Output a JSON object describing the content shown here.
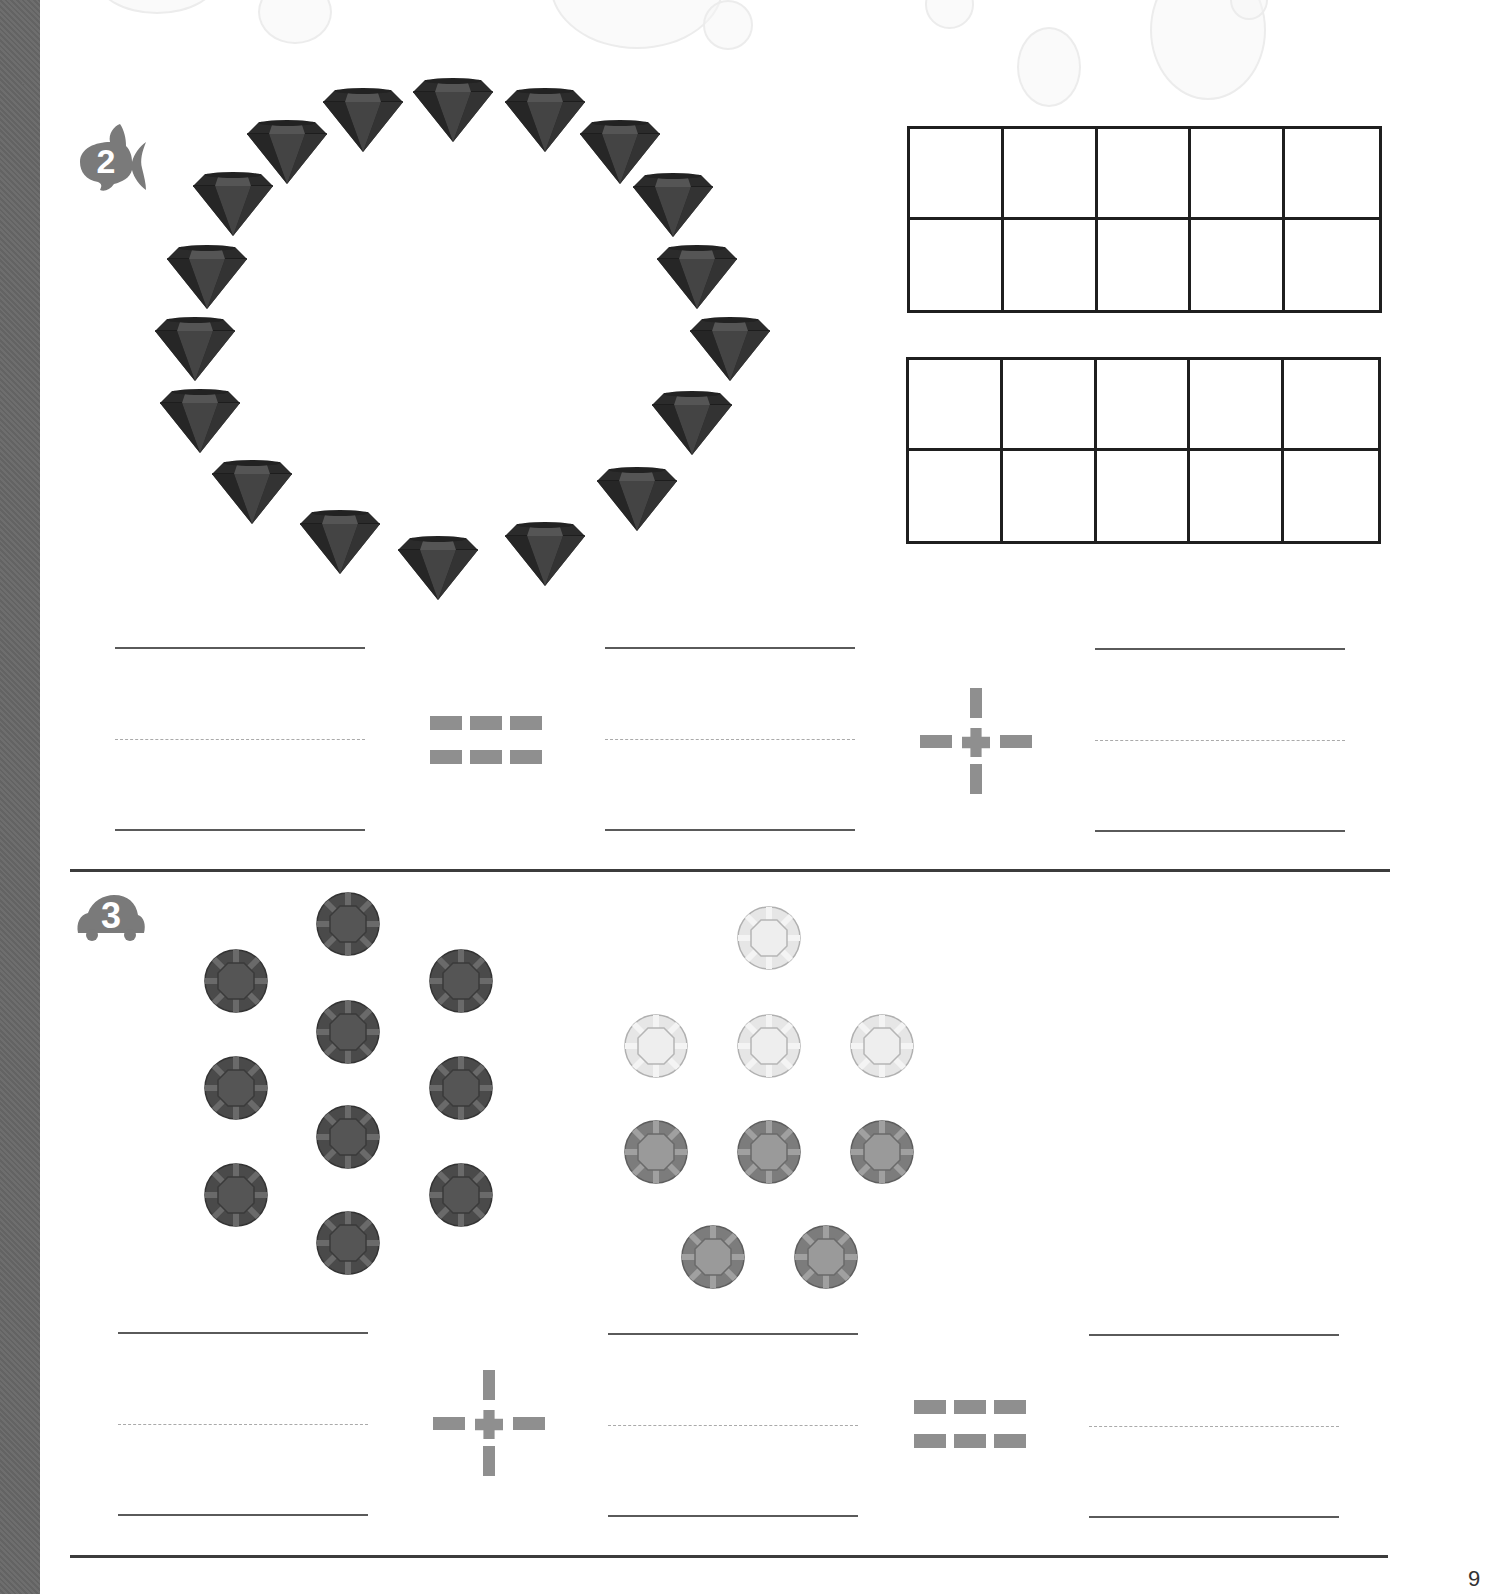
{
  "page": {
    "background": "#ffffff",
    "sidebar_color": "#686868",
    "page_number": "9"
  },
  "problem2": {
    "number": "2",
    "badge_icon": "fish-icon",
    "badge_color": "#7a7a7a",
    "objects": {
      "type": "diamond",
      "count": 18,
      "arrangement": "ring",
      "color": "#2e2e2e"
    },
    "ten_frames": [
      {
        "rows": 2,
        "cols": 5,
        "filled": 0
      },
      {
        "rows": 2,
        "cols": 5,
        "filled": 0
      }
    ],
    "equation": {
      "blanks": [
        "",
        "",
        ""
      ],
      "operators": [
        "=",
        "+"
      ]
    }
  },
  "problem3": {
    "number": "3",
    "badge_icon": "car-icon",
    "badge_color": "#7a7a7a",
    "group_a": {
      "type": "round-gem",
      "count": 11,
      "shade": "dark",
      "color": "#585858"
    },
    "group_b": {
      "type": "round-gem",
      "light_count": 4,
      "medium_count": 5,
      "light_color": "#e4e4e4",
      "medium_color": "#8a8a8a"
    },
    "equation": {
      "blanks": [
        "",
        "",
        ""
      ],
      "operators": [
        "+",
        "="
      ]
    }
  },
  "operators": {
    "equals": "=",
    "plus": "+"
  }
}
